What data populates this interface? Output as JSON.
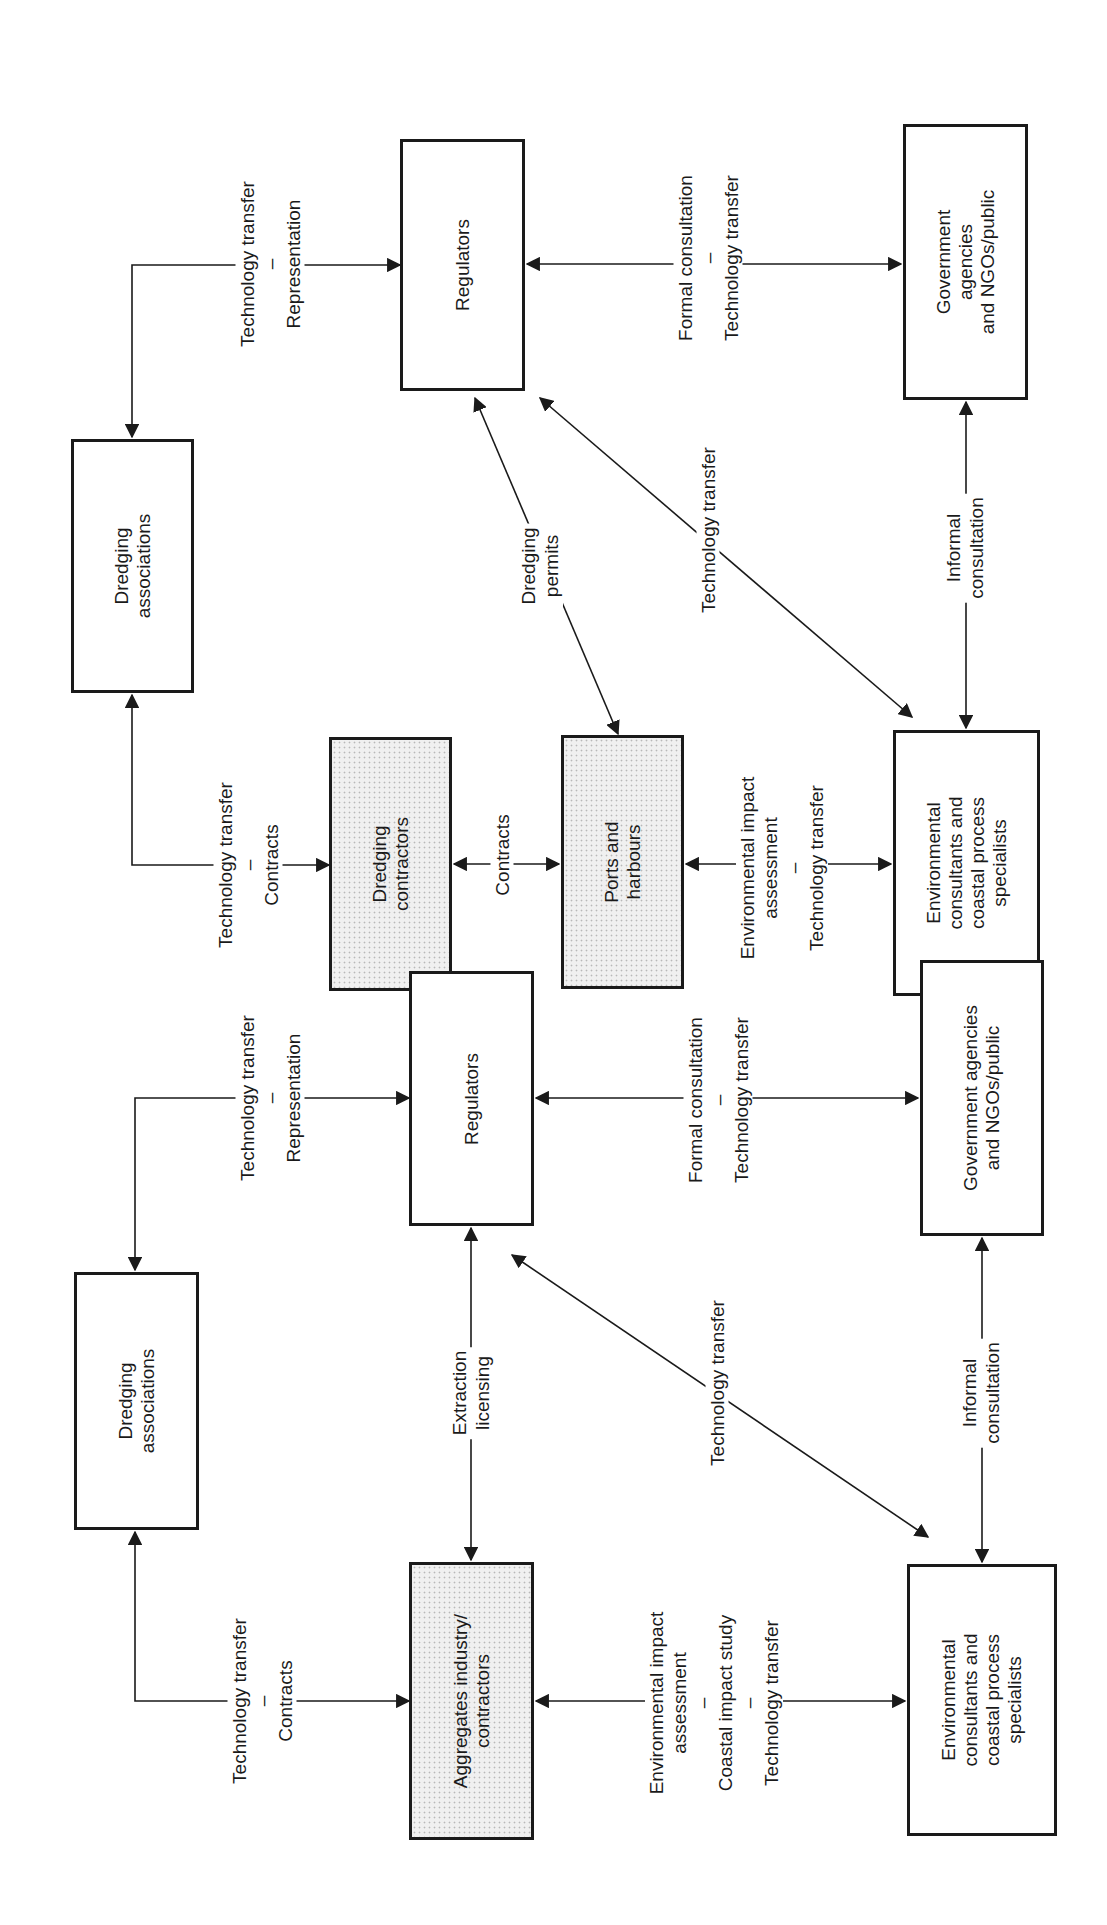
{
  "diagrams": [
    {
      "nodes": {
        "dredging_associations": "Dredging\nassociations",
        "regulators": "Regulators",
        "dredging_contractors": "Dredging\ncontractors",
        "ports_harbours": "Ports and\nharbours",
        "government": "Government\nagencies\nand NGOs/public",
        "env_consultants": "Environmental\nconsultants and\ncoastal process\nspecialists"
      },
      "edges": {
        "assoc_regulators": "Technology transfer\n–\nRepresentation",
        "assoc_contractors": "Technology transfer\n–\nContracts",
        "contractors_ports": "Contracts",
        "ports_regulators": "Dredging\npermits",
        "regulators_gov": "Formal consultation\n–\nTechnology transfer",
        "regulators_env": "Technology transfer",
        "ports_env": "Environmental impact\nassessment\n–\nTechnology transfer",
        "env_gov": "Informal\nconsultation"
      }
    },
    {
      "nodes": {
        "dredging_associations": "Dredging\nassociations",
        "regulators": "Regulators",
        "aggregates": "Aggregates industry/\ncontractors",
        "government": "Government agencies\nand NGOs/public",
        "env_consultants": "Environmental\nconsultants and\ncoastal process\nspecialists"
      },
      "edges": {
        "assoc_regulators": "Technology transfer\n–\nRepresentation",
        "assoc_aggregates": "Technology transfer\n–\nContracts",
        "aggregates_regulators": "Extraction\nlicensing",
        "regulators_gov": "Formal consultation\n–\nTechnology transfer",
        "regulators_env": "Technology transfer",
        "aggregates_env": "Environmental impact\nassessment\n–\nCoastal impact study\n–\nTechnology transfer",
        "env_gov": "Informal\nconsultation"
      }
    }
  ]
}
